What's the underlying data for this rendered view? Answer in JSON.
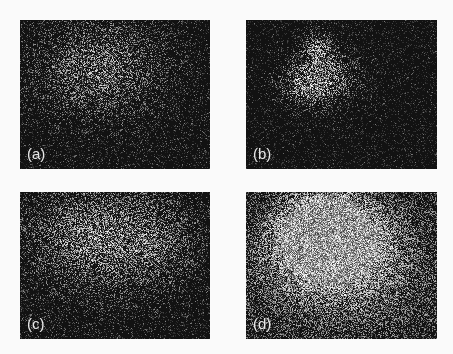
{
  "figure": {
    "background": "#fafafa",
    "panels": [
      {
        "id": "a",
        "label": "(a)",
        "box": {
          "x": 20,
          "y": 20,
          "w": 190,
          "h": 149
        },
        "blobs": [
          {
            "cx": 0.42,
            "cy": 0.32,
            "sx": 0.22,
            "sy": 0.22,
            "amp": 0.55
          }
        ],
        "noise_density": 0.28,
        "base": 0.05
      },
      {
        "id": "b",
        "label": "(b)",
        "box": {
          "x": 246,
          "y": 20,
          "w": 191,
          "h": 149
        },
        "blobs": [
          {
            "cx": 0.4,
            "cy": 0.38,
            "sx": 0.12,
            "sy": 0.12,
            "amp": 0.75
          },
          {
            "cx": 0.38,
            "cy": 0.18,
            "sx": 0.05,
            "sy": 0.07,
            "amp": 0.6
          },
          {
            "cx": 0.3,
            "cy": 0.45,
            "sx": 0.08,
            "sy": 0.08,
            "amp": 0.4
          }
        ],
        "noise_density": 0.14,
        "base": 0.03
      },
      {
        "id": "c",
        "label": "(c)",
        "box": {
          "x": 20,
          "y": 192,
          "w": 190,
          "h": 147
        },
        "blobs": [
          {
            "cx": 0.4,
            "cy": 0.3,
            "sx": 0.25,
            "sy": 0.25,
            "amp": 0.6
          },
          {
            "cx": 0.75,
            "cy": 0.35,
            "sx": 0.15,
            "sy": 0.2,
            "amp": 0.25
          }
        ],
        "noise_density": 0.32,
        "base": 0.06
      },
      {
        "id": "d",
        "label": "(d)",
        "box": {
          "x": 246,
          "y": 192,
          "w": 191,
          "h": 147
        },
        "blobs": [
          {
            "cx": 0.42,
            "cy": 0.28,
            "sx": 0.18,
            "sy": 0.2,
            "amp": 1.0
          },
          {
            "cx": 0.5,
            "cy": 0.5,
            "sx": 0.38,
            "sy": 0.35,
            "amp": 0.55
          }
        ],
        "noise_density": 0.55,
        "base": 0.1
      }
    ]
  }
}
